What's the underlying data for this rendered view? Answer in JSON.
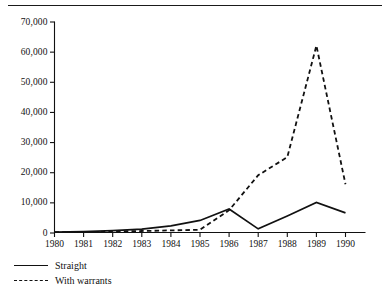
{
  "figure": {
    "has_top_rule": true,
    "background_color": "#ffffff",
    "ink_color": "#111111"
  },
  "chart_data": {
    "type": "line",
    "title": "",
    "xlabel": "",
    "ylabel": "",
    "x": [
      1980,
      1981,
      1982,
      1983,
      1984,
      1985,
      1986,
      1987,
      1988,
      1989,
      1990
    ],
    "categories": [
      "1980",
      "1981",
      "1982",
      "1983",
      "1984",
      "1985",
      "1986",
      "1987",
      "1988",
      "1989",
      "1990"
    ],
    "xlim": [
      1980,
      1990
    ],
    "ylim": [
      0,
      70000
    ],
    "yticks": [
      0,
      10000,
      20000,
      30000,
      40000,
      50000,
      60000,
      70000
    ],
    "ytick_labels": [
      "0",
      "10,000",
      "20,000",
      "30,000",
      "40,000",
      "50,000",
      "60,000",
      "70,000"
    ],
    "grid": false,
    "legend_position": "below-left",
    "series": [
      {
        "name": "Straight",
        "style": "solid",
        "color": "#111111",
        "values": [
          150,
          300,
          600,
          1100,
          2200,
          4000,
          7800,
          1200,
          5500,
          10000,
          6500
        ]
      },
      {
        "name": "With warrants",
        "style": "dashed",
        "color": "#111111",
        "values": [
          100,
          150,
          300,
          500,
          700,
          900,
          7400,
          19000,
          25000,
          62000,
          16000
        ]
      }
    ]
  },
  "legend": {
    "items": [
      {
        "label": "Straight",
        "key": "solid-line-key"
      },
      {
        "label": "With warrants",
        "key": "dashed-line-key"
      }
    ]
  }
}
